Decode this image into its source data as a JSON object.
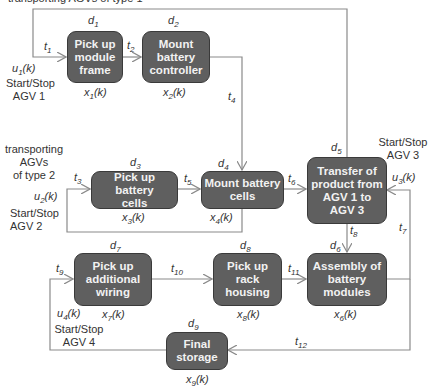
{
  "diagram": {
    "top_partial_label": "transporting AGVs of type 1",
    "side_label_type2": [
      "transporting",
      "AGVs",
      "of type 2"
    ],
    "nodes": [
      {
        "id": "x1",
        "label": "Pick up module frame",
        "lines": [
          "Pick up",
          "module",
          "frame"
        ],
        "delay": "d",
        "delay_sub": "1",
        "state": "x",
        "state_sub": "1",
        "state_suffix": "(k)"
      },
      {
        "id": "x2",
        "label": "Mount battery controller",
        "lines": [
          "Mount",
          "battery",
          "controller"
        ],
        "delay": "d",
        "delay_sub": "2",
        "state": "x",
        "state_sub": "2",
        "state_suffix": "(k)"
      },
      {
        "id": "x3",
        "label": "Pick up battery cells",
        "lines": [
          "Pick up battery",
          "cells"
        ],
        "delay": "d",
        "delay_sub": "3",
        "state": "x",
        "state_sub": "3",
        "state_suffix": "(k)"
      },
      {
        "id": "x4",
        "label": "Mount battery cells",
        "lines": [
          "Mount battery",
          "cells"
        ],
        "delay": "d",
        "delay_sub": "4",
        "state": "x",
        "state_sub": "4",
        "state_suffix": "(k)"
      },
      {
        "id": "x5",
        "label": "Transfer of product from AGV 1 to AGV 3",
        "lines": [
          "Transfer of",
          "product from",
          "AGV 1 to",
          "AGV 3"
        ],
        "delay": "d",
        "delay_sub": "5",
        "state": "",
        "state_sub": "",
        "state_suffix": ""
      },
      {
        "id": "x6",
        "label": "Assembly of battery modules",
        "lines": [
          "Assembly of",
          "battery",
          "modules"
        ],
        "delay": "d",
        "delay_sub": "6",
        "state": "x",
        "state_sub": "6",
        "state_suffix": "(k)"
      },
      {
        "id": "x7",
        "label": "Pick up additional wiring",
        "lines": [
          "Pick up",
          "additional",
          "wiring"
        ],
        "delay": "d",
        "delay_sub": "7",
        "state": "x",
        "state_sub": "7",
        "state_suffix": "(k)"
      },
      {
        "id": "x8",
        "label": "Pick up rack housing",
        "lines": [
          "Pick up",
          "rack",
          "housing"
        ],
        "delay": "d",
        "delay_sub": "8",
        "state": "x",
        "state_sub": "8",
        "state_suffix": "(k)"
      },
      {
        "id": "x9",
        "label": "Final storage",
        "lines": [
          "Final",
          "storage"
        ],
        "delay": "d",
        "delay_sub": "9",
        "state": "x",
        "state_sub": "9",
        "state_suffix": "(k)"
      }
    ],
    "transitions": [
      "t1",
      "t2",
      "t3",
      "t4",
      "t5",
      "t6",
      "t7",
      "t8",
      "t9",
      "t10",
      "t11",
      "t12"
    ],
    "inputs": [
      {
        "id": "u1",
        "sym": "u",
        "sub": "1",
        "suffix": "(k)",
        "caption": [
          "Start/Stop",
          "AGV 1"
        ]
      },
      {
        "id": "u2",
        "sym": "u",
        "sub": "2",
        "suffix": "(k)",
        "caption": [
          "Start/Stop",
          "AGV 2"
        ]
      },
      {
        "id": "u3",
        "sym": "u",
        "sub": "3",
        "suffix": "(k)",
        "caption": [
          "Start/Stop",
          "AGV 3"
        ]
      },
      {
        "id": "u4",
        "sym": "u",
        "sub": "4",
        "suffix": "(k)",
        "caption": [
          "Start/Stop",
          "AGV 4"
        ]
      }
    ],
    "colors": {
      "box_fill": "#5f5f5f",
      "box_border": "#3a3a3a",
      "box_text": "#f2f2f2",
      "wire": "#8a8a8a",
      "label": "#333333"
    }
  }
}
